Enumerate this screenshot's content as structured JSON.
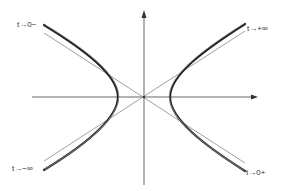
{
  "figure": {
    "labels": {
      "top_left": "t→0−",
      "top_right": "t→+∞",
      "bottom_left": "t→−∞",
      "bottom_right": "t→0+"
    },
    "colors": {
      "curve": "#222222",
      "asymptote": "#777777",
      "axis": "#555555",
      "background": "#ffffff"
    },
    "geometry": {
      "origin": [
        144,
        97
      ],
      "vertex_offset": 26,
      "asymptote_slope": 0.64
    }
  }
}
